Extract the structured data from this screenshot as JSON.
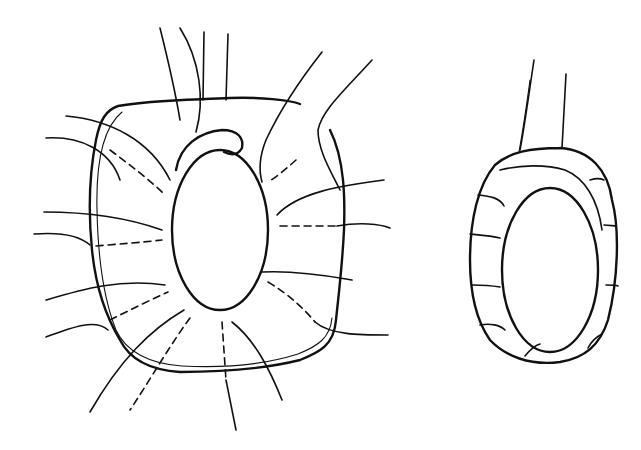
{
  "figure": {
    "background": "#ffffff",
    "ink": "#111111",
    "panels": [
      {
        "id": "left",
        "subject": "ovoid stippled body surrounded by a rounded-square sheath with radiating filaments",
        "center": [
          220,
          230
        ]
      },
      {
        "id": "right",
        "subject": "ovoid stippled body enclosed by a ring of segmented cells with two upward filaments",
        "center": [
          550,
          265
        ]
      }
    ]
  }
}
